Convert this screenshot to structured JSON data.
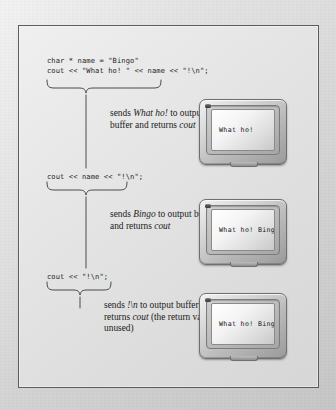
{
  "figure": {
    "domain": "diagram",
    "background_color": "#dcdcdc",
    "frame_border_color": "#5d5d5d",
    "ink_color": "#1d1d1d"
  },
  "steps": [
    {
      "id": "step-1",
      "code_lines": [
        "char * name = \"Bingo\"",
        "cout << \"What ho! \" << name << \"!\\n\";"
      ],
      "annotation": {
        "segments": [
          {
            "text": "sends ",
            "style": "roman"
          },
          {
            "text": "What ho!",
            "style": "italic"
          },
          {
            "text": " to output buffer and returns ",
            "style": "roman"
          },
          {
            "text": "cout",
            "style": "italic"
          }
        ]
      },
      "monitor": {
        "name": "monitor-1",
        "screen_text": "What ho!",
        "led": "power-led"
      }
    },
    {
      "id": "step-2",
      "code_lines": [
        "cout << name << \"!\\n\";"
      ],
      "annotation": {
        "segments": [
          {
            "text": "sends ",
            "style": "roman"
          },
          {
            "text": "Bingo",
            "style": "italic"
          },
          {
            "text": " to output buffer and returns ",
            "style": "roman"
          },
          {
            "text": "cout",
            "style": "italic"
          }
        ]
      },
      "monitor": {
        "name": "monitor-2",
        "screen_text": "What ho! Bingo",
        "led": "power-led"
      }
    },
    {
      "id": "step-3",
      "code_lines": [
        "cout << \"!\\n\";"
      ],
      "annotation": {
        "segments": [
          {
            "text": "sends ",
            "style": "roman"
          },
          {
            "text": "!\\n",
            "style": "italic"
          },
          {
            "text": " to output buffer and returns ",
            "style": "roman"
          },
          {
            "text": "cout",
            "style": "italic"
          },
          {
            "text": " (the return value is unused)",
            "style": "roman"
          }
        ]
      },
      "monitor": {
        "name": "monitor-3",
        "screen_text": "What ho! Bingo",
        "led": "power-led"
      }
    }
  ],
  "code": {
    "line_1_1": "char * name = \"Bingo\"",
    "line_1_2": "cout << \"What ho! \" << name << \"!\\n\";",
    "line_2_1": "cout << name << \"!\\n\";",
    "line_3_1": "cout << \"!\\n\";"
  },
  "annotations": {
    "note_1_lead": "sends ",
    "note_1_em1": "What ho!",
    "note_1_mid": " to output buffer and returns ",
    "note_1_em2": "cout",
    "note_2_lead": "sends ",
    "note_2_em1": "Bingo",
    "note_2_mid": " to output buffer and returns ",
    "note_2_em2": "cout",
    "note_3_lead": "sends ",
    "note_3_em1": "!\\n",
    "note_3_mid": " to output buffer and returns ",
    "note_3_em2": "cout",
    "note_3_tail": " (the return value is unused)"
  },
  "screens": {
    "screen_1_text": "What ho!",
    "screen_2_text": "What ho! Bingo",
    "screen_3_text": "What ho! Bingo"
  }
}
